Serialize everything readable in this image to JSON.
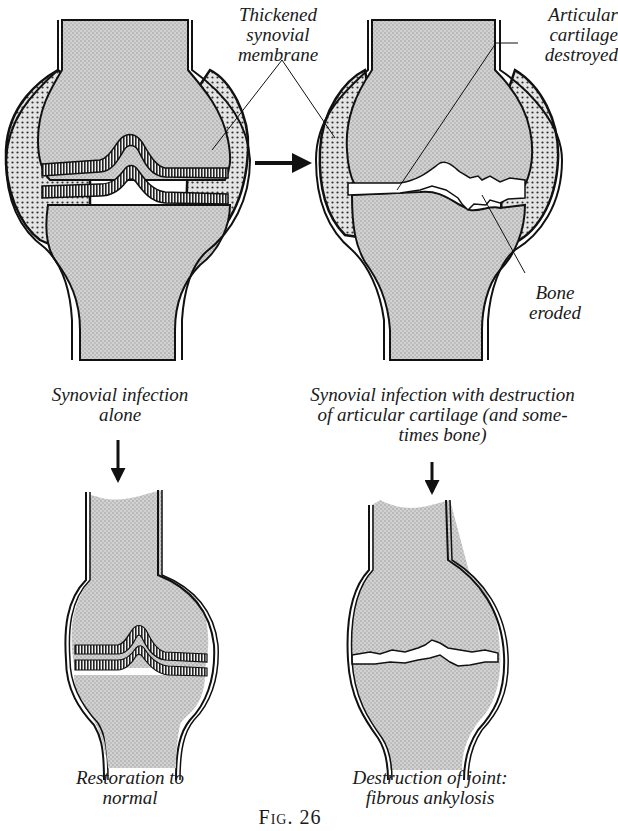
{
  "figure": {
    "caption": "Fig. 26",
    "annotations": {
      "thickened_synovial_membrane": [
        "Thickened",
        "synovial",
        "membrane"
      ],
      "articular_cartilage_destroyed": [
        "Articular",
        "cartilage",
        "destroyed"
      ],
      "bone_eroded": [
        "Bone",
        "eroded"
      ]
    },
    "panels": [
      {
        "id": "top-left",
        "lines": [
          "Synovial infection",
          "alone"
        ]
      },
      {
        "id": "top-right",
        "lines": [
          "Synovial infection with destruction",
          "of articular cartilage (and some-",
          "times bone)"
        ]
      },
      {
        "id": "bottom-left",
        "lines": [
          "Restoration to",
          "normal"
        ]
      },
      {
        "id": "bottom-right",
        "lines": [
          "Destruction of joint:",
          "fibrous ankylosis"
        ]
      }
    ],
    "arrows": [
      {
        "from": "top-left",
        "to": "top-right",
        "direction": "right"
      },
      {
        "from": "top-left",
        "to": "bottom-left",
        "direction": "down"
      },
      {
        "from": "top-right",
        "to": "bottom-right",
        "direction": "down"
      }
    ],
    "colors": {
      "ink": "#111111",
      "bone_fill": "#c8c8c8",
      "synovium_fill": "#bdbdbd",
      "paper": "#ffffff"
    }
  }
}
